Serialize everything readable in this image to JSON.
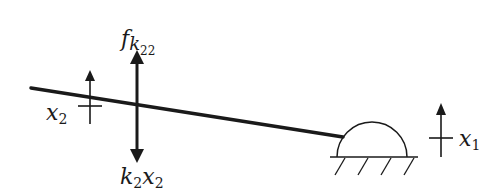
{
  "diagram": {
    "type": "mechanical free-body / lever diagram",
    "colors": {
      "stroke": "#1a1a1a",
      "background": "#ffffff"
    },
    "labels": {
      "force_top": {
        "base": "f",
        "sub": "k",
        "subsub": "22"
      },
      "force_bottom": {
        "k": "k",
        "k_sub": "2",
        "x": "x",
        "x_sub": "2"
      },
      "disp_left": {
        "base": "x",
        "sub": "2"
      },
      "disp_right": {
        "base": "x",
        "sub": "1"
      }
    },
    "elements": [
      {
        "name": "beam",
        "kind": "thick line",
        "from": [
          31,
          88
        ],
        "to": [
          343,
          137
        ]
      },
      {
        "name": "force-arrow",
        "kind": "double-headed arrow",
        "x": 137,
        "from_y": 53,
        "to_y": 160
      },
      {
        "name": "displacement-x2",
        "kind": "up arrow with crossbar",
        "x": 90,
        "top": 70,
        "bottom": 124,
        "crossbar_y": 106
      },
      {
        "name": "support-dome",
        "kind": "semicircle pivot on hatched ground",
        "cx": 372,
        "base_y": 157,
        "r": 35
      },
      {
        "name": "displacement-x1",
        "kind": "up arrow with crossbar",
        "x": 441,
        "top": 103,
        "bottom": 157,
        "crossbar_y": 138
      }
    ]
  }
}
